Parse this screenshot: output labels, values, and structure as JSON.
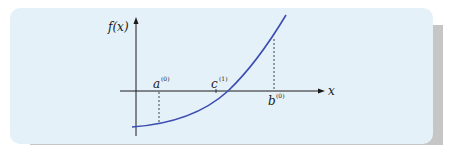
{
  "figure": {
    "y_axis_label": "f(x)",
    "x_axis_label": "x",
    "points": [
      {
        "name": "a",
        "sup": "(0)"
      },
      {
        "name": "c",
        "sup": "(1)"
      },
      {
        "name": "b",
        "sup": "(0)"
      }
    ],
    "colors": {
      "background": "#e5f1f9",
      "shadow": "#c6c6c6",
      "curve": "#3b4db0",
      "axes": "#1a1a1a"
    }
  }
}
